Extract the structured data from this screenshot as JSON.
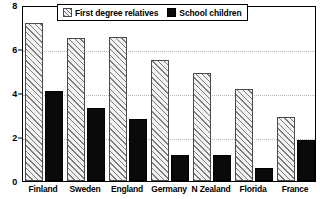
{
  "chart_data": {
    "type": "bar",
    "title": "",
    "subtitle": "",
    "xlabel": "",
    "ylabel": "",
    "categories": [
      "Finland",
      "Sweden",
      "England",
      "Germany",
      "N Zealand",
      "Florida",
      "France"
    ],
    "series": [
      {
        "name": "First degree relatives",
        "fill": "hatched",
        "color": "#f2f2f2",
        "values": [
          7.2,
          6.5,
          6.55,
          5.5,
          4.9,
          4.2,
          2.9
        ]
      },
      {
        "name": "School children",
        "fill": "solid",
        "color": "#0a0a0a",
        "values": [
          4.1,
          3.3,
          2.8,
          1.2,
          1.2,
          0.6,
          1.85
        ]
      }
    ],
    "ylim": [
      0,
      8
    ],
    "yticks": [
      0,
      2,
      4,
      6,
      8
    ],
    "ytick_labels": [
      "0",
      "2",
      "4",
      "6",
      "8"
    ],
    "grid": true,
    "grid_axis": "y",
    "legend_position": "top-center",
    "frame": true
  },
  "legend": {
    "entries": [
      {
        "label": "First degree relatives",
        "swatch": "hatched-swatch"
      },
      {
        "label": "School children",
        "swatch": "solid-swatch"
      }
    ]
  },
  "colors": {
    "axis": "#000000",
    "grid": "#b9b9b9",
    "background": "#ffffff",
    "series_1": "#f2f2f2",
    "series_2": "#0a0a0a"
  }
}
